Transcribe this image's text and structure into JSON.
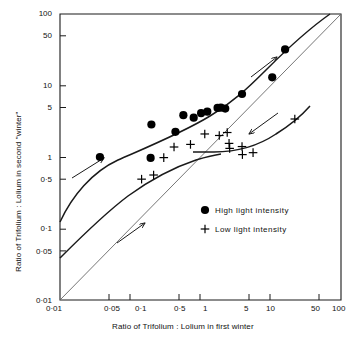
{
  "chart_data": {
    "type": "scatter",
    "title": "",
    "xlabel": "Ratio of Trifolium : Lolium in first winter",
    "ylabel": "Ratio of Trifolium : Lolium in second \"winter\"",
    "xscale": "log",
    "yscale": "log",
    "xlim": [
      0.01,
      100
    ],
    "ylim": [
      0.01,
      100
    ],
    "grid": false,
    "legend_position": "center-right-inside",
    "xticks": [
      "0·01",
      "0·05",
      "0·1",
      "0·5",
      "1",
      "5",
      "10",
      "50",
      "100"
    ],
    "xtick_values": [
      0.01,
      0.05,
      0.1,
      0.5,
      1,
      5,
      10,
      50,
      100
    ],
    "yticks": [
      "0·01",
      "0·05",
      "0·1",
      "0·5",
      "1",
      "5",
      "10",
      "50",
      "100"
    ],
    "ytick_values": [
      0.01,
      0.05,
      0.1,
      0.5,
      1,
      5,
      10,
      50,
      100
    ],
    "series": [
      {
        "name": "High light intensity",
        "marker": "filled-circle",
        "color": "#000000",
        "points": [
          [
            0.037,
            1.0
          ],
          [
            0.195,
            0.97
          ],
          [
            0.2,
            2.85
          ],
          [
            0.44,
            2.25
          ],
          [
            0.57,
            3.85
          ],
          [
            0.8,
            3.55
          ],
          [
            1.02,
            4.1
          ],
          [
            1.25,
            4.3
          ],
          [
            1.75,
            4.85
          ],
          [
            1.95,
            4.9
          ],
          [
            2.25,
            4.75
          ],
          [
            3.9,
            7.6
          ],
          [
            10.5,
            13.0
          ],
          [
            16.0,
            32.0
          ]
        ]
      },
      {
        "name": "Low light intensity",
        "marker": "plus",
        "color": "#000000",
        "points": [
          [
            0.145,
            0.49
          ],
          [
            0.215,
            0.56
          ],
          [
            0.3,
            0.98
          ],
          [
            0.42,
            1.38
          ],
          [
            0.72,
            1.5
          ],
          [
            1.15,
            2.1
          ],
          [
            1.85,
            2.0
          ],
          [
            2.4,
            2.2
          ],
          [
            2.55,
            1.55
          ],
          [
            2.6,
            1.32
          ],
          [
            3.9,
            1.4
          ],
          [
            3.95,
            1.08
          ],
          [
            5.6,
            1.15
          ],
          [
            22.0,
            3.4
          ]
        ]
      }
    ],
    "reference_line": {
      "name": "1:1 line",
      "from": [
        0.01,
        0.01
      ],
      "to": [
        100,
        100
      ]
    },
    "fitted_curves": [
      {
        "name": "high-light-curve"
      },
      {
        "name": "low-light-rising-curve"
      },
      {
        "name": "low-light-flat-curve"
      }
    ],
    "annotations": [
      {
        "name": "arrow-lower-left",
        "meaning": "direction of change"
      },
      {
        "name": "arrow-upper-right",
        "meaning": "direction of change"
      },
      {
        "name": "arrow-middle-left",
        "meaning": "direction of change"
      },
      {
        "name": "arrow-down-right",
        "meaning": "direction of change"
      }
    ]
  },
  "legend": {
    "items": [
      {
        "marker": "filled-circle",
        "label": "High  light  intensity"
      },
      {
        "marker": "plus",
        "label": "Low  light  intensity"
      }
    ]
  }
}
